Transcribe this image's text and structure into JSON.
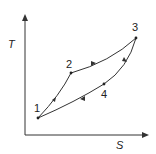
{
  "diagram": {
    "type": "T-S thermodynamic cycle",
    "axes": {
      "y_label": "T",
      "x_label": "S"
    },
    "points": [
      {
        "id": "1",
        "label": "1"
      },
      {
        "id": "2",
        "label": "2"
      },
      {
        "id": "3",
        "label": "3"
      },
      {
        "id": "4",
        "label": "4"
      }
    ],
    "processes": [
      {
        "from": "1",
        "to": "2"
      },
      {
        "from": "2",
        "to": "3"
      },
      {
        "from": "3",
        "to": "4"
      },
      {
        "from": "4",
        "to": "1"
      }
    ],
    "colors": {
      "line": "#333333",
      "background": "#ffffff"
    }
  }
}
